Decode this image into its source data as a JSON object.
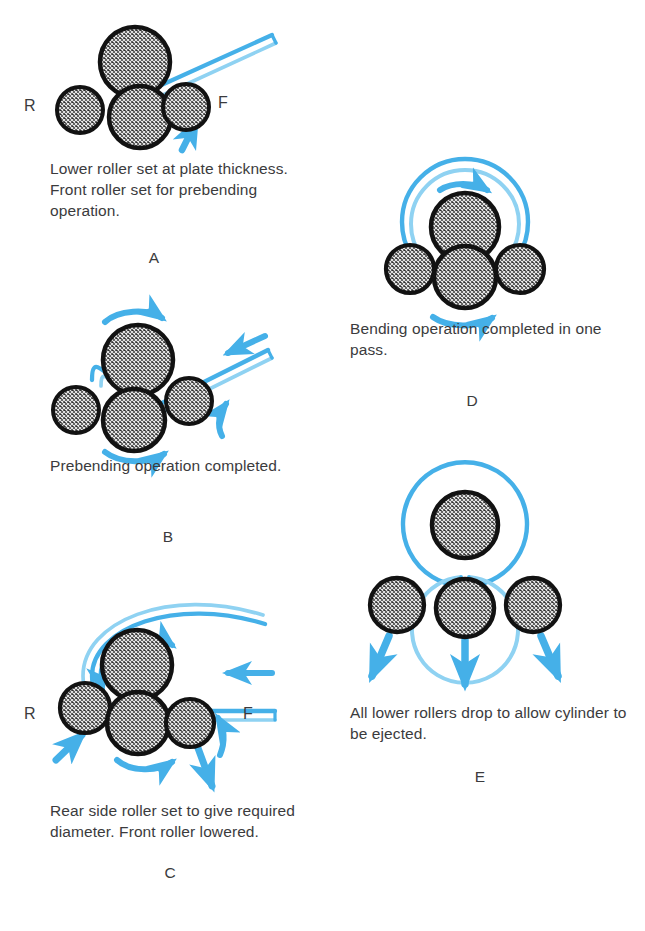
{
  "figure": {
    "accent_blue": "#45b0e8",
    "accent_blue_light": "#8fd2f2",
    "roller_dark": "#1a1a1a",
    "roller_fill": "#4a4a4a",
    "text_color": "#3b3b3d",
    "background": "#ffffff"
  },
  "panels": [
    {
      "id": "A",
      "letter": "A",
      "caption": "Lower roller set at plate\nthickness. Front roller set\nfor prebending operation.",
      "labels": {
        "rear": "R",
        "front": "F"
      },
      "rollers": [
        {
          "name": "top-roller",
          "cx": 135,
          "cy": 62,
          "r": 35
        },
        {
          "name": "rear-side-roller",
          "cx": 80,
          "cy": 110,
          "r": 23
        },
        {
          "name": "bottom-roller",
          "cx": 140,
          "cy": 117,
          "r": 31
        },
        {
          "name": "front-side-roller",
          "cx": 186,
          "cy": 107,
          "r": 23
        }
      ]
    },
    {
      "id": "B",
      "letter": "B",
      "caption": "Prebending operation\ncompleted.",
      "labels": {
        "rear": "",
        "front": ""
      },
      "rollers": [
        {
          "name": "top-roller",
          "cx": 138,
          "cy": 360,
          "r": 35
        },
        {
          "name": "rear-side-roller",
          "cx": 76,
          "cy": 410,
          "r": 23
        },
        {
          "name": "bottom-roller",
          "cx": 134,
          "cy": 420,
          "r": 31
        },
        {
          "name": "front-side-roller",
          "cx": 189,
          "cy": 401,
          "r": 23
        }
      ]
    },
    {
      "id": "C",
      "letter": "C",
      "caption": "Rear side roller set to give\nrequired diameter. Front\nroller lowered.",
      "labels": {
        "rear": "R",
        "front": "F"
      },
      "rollers": [
        {
          "name": "top-roller",
          "cx": 137,
          "cy": 665,
          "r": 35
        },
        {
          "name": "rear-side-roller",
          "cx": 85,
          "cy": 708,
          "r": 25
        },
        {
          "name": "bottom-roller",
          "cx": 138,
          "cy": 723,
          "r": 31
        },
        {
          "name": "front-side-roller",
          "cx": 190,
          "cy": 723,
          "r": 24
        }
      ]
    },
    {
      "id": "D",
      "letter": "D",
      "caption": "Bending operation\ncompleted in one pass.",
      "labels": {
        "rear": "",
        "front": ""
      },
      "rollers": [
        {
          "name": "top-roller",
          "cx": 465,
          "cy": 227,
          "r": 34
        },
        {
          "name": "rear-side-roller",
          "cx": 410,
          "cy": 269,
          "r": 24
        },
        {
          "name": "bottom-roller",
          "cx": 465,
          "cy": 277,
          "r": 31
        },
        {
          "name": "front-side-roller",
          "cx": 520,
          "cy": 269,
          "r": 24
        }
      ],
      "cylinder": {
        "name": "formed-cylinder",
        "cx": 465,
        "cy": 222,
        "r_outer": 63,
        "r_inner": 54
      }
    },
    {
      "id": "E",
      "letter": "E",
      "caption": "All lower rollers drop to allow\ncylinder to be ejected.",
      "labels": {
        "rear": "",
        "front": ""
      },
      "rollers": [
        {
          "name": "top-roller",
          "cx": 465,
          "cy": 525,
          "r": 33
        },
        {
          "name": "rear-side-roller",
          "cx": 397,
          "cy": 605,
          "r": 27
        },
        {
          "name": "bottom-roller",
          "cx": 465,
          "cy": 608,
          "r": 29
        },
        {
          "name": "front-side-roller",
          "cx": 533,
          "cy": 605,
          "r": 27
        }
      ],
      "cylinder": {
        "name": "formed-cylinder",
        "cx": 465,
        "cy": 524,
        "r_outer": 62,
        "r_inner": 53
      }
    }
  ],
  "captions": {
    "a": "Lower roller set at plate thickness. Front roller set for prebending operation.",
    "b": "Prebending operation completed.",
    "c": "Rear side roller set to give required diameter. Front roller lowered.",
    "d": "Bending operation completed in one pass.",
    "e": "All lower rollers drop to allow cylinder to be ejected."
  },
  "caption_lines": {
    "a": [
      "Lower roller set at plate",
      "thickness. Front roller set",
      "for prebending operation."
    ],
    "b": [
      "Prebending operation",
      "completed."
    ],
    "c": [
      "Rear side roller set to give",
      "required diameter. Front",
      "roller lowered."
    ],
    "d": [
      "Bending operation",
      "completed in one pass."
    ],
    "e": [
      "All lower rollers drop to allow",
      "cylinder to be ejected."
    ]
  },
  "letters": {
    "a": "A",
    "b": "B",
    "c": "C",
    "d": "D",
    "e": "E"
  },
  "side_labels": {
    "a_rear": "R",
    "a_front": "F",
    "c_rear": "R",
    "c_front": "F"
  }
}
